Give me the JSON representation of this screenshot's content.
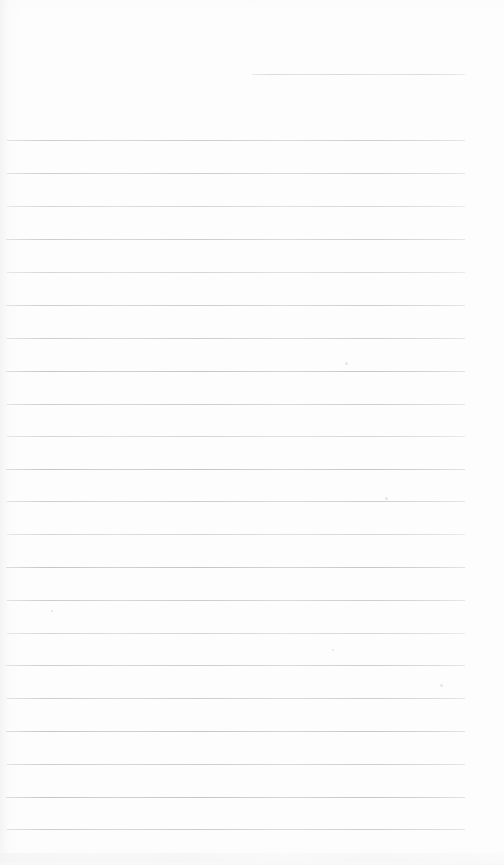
{
  "document": {
    "kind": "scanned-ruled-paper",
    "title": "Blank ruled notebook page",
    "text_content": "",
    "width": 504,
    "height": 865,
    "background_color": "#fdfdfd",
    "rule_color": "#cbccce",
    "rule_color_faint": "#d9dadc",
    "rule_color_strong": "#c3c4c7"
  },
  "ruling": {
    "line_left": 7,
    "line_right": 465,
    "first_full_line_y": 140,
    "line_spacing": 32.8,
    "line_thickness": 1,
    "line_count": 22,
    "lines": [
      {
        "y": 74,
        "left": 252,
        "right": 465,
        "weight": "partial"
      },
      {
        "y": 140,
        "left": 7,
        "right": 465,
        "weight": "normal"
      },
      {
        "y": 173,
        "left": 7,
        "right": 465,
        "weight": "normal"
      },
      {
        "y": 206,
        "left": 7,
        "right": 465,
        "weight": "faint"
      },
      {
        "y": 239,
        "left": 6,
        "right": 465,
        "weight": "normal"
      },
      {
        "y": 272,
        "left": 7,
        "right": 465,
        "weight": "faint"
      },
      {
        "y": 305,
        "left": 6,
        "right": 465,
        "weight": "normal"
      },
      {
        "y": 338,
        "left": 7,
        "right": 465,
        "weight": "normal"
      },
      {
        "y": 371,
        "left": 6,
        "right": 465,
        "weight": "strong"
      },
      {
        "y": 404,
        "left": 7,
        "right": 465,
        "weight": "normal"
      },
      {
        "y": 436,
        "left": 7,
        "right": 465,
        "weight": "faint"
      },
      {
        "y": 469,
        "left": 6,
        "right": 465,
        "weight": "strong"
      },
      {
        "y": 501,
        "left": 7,
        "right": 465,
        "weight": "normal"
      },
      {
        "y": 534,
        "left": 7,
        "right": 465,
        "weight": "faint"
      },
      {
        "y": 567,
        "left": 6,
        "right": 465,
        "weight": "strong"
      },
      {
        "y": 600,
        "left": 7,
        "right": 465,
        "weight": "normal"
      },
      {
        "y": 633,
        "left": 7,
        "right": 465,
        "weight": "faint"
      },
      {
        "y": 665,
        "left": 6,
        "right": 465,
        "weight": "normal"
      },
      {
        "y": 698,
        "left": 7,
        "right": 465,
        "weight": "normal"
      },
      {
        "y": 731,
        "left": 6,
        "right": 465,
        "weight": "strong"
      },
      {
        "y": 764,
        "left": 7,
        "right": 465,
        "weight": "normal"
      },
      {
        "y": 797,
        "left": 6,
        "right": 465,
        "weight": "strong"
      },
      {
        "y": 829,
        "left": 7,
        "right": 465,
        "weight": "normal"
      }
    ]
  },
  "artifacts": {
    "specks": [
      {
        "x": 385,
        "y": 497,
        "size": 3
      },
      {
        "x": 440,
        "y": 684,
        "size": 3
      },
      {
        "x": 345,
        "y": 362,
        "size": 3
      },
      {
        "x": 51,
        "y": 610,
        "size": 2
      },
      {
        "x": 332,
        "y": 649,
        "size": 2
      }
    ],
    "bottom_smudge_y": 853
  }
}
